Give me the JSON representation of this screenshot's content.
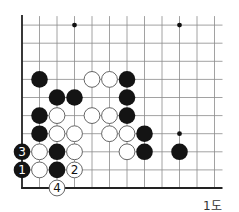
{
  "diagram": {
    "caption": "1도",
    "board": {
      "cols": 12,
      "rows": 10,
      "origin_x": 22,
      "origin_y": 188,
      "col_spacing": 17.5,
      "row_spacing": 18.1,
      "edges": [
        "left",
        "bottom"
      ],
      "line_color": "#8a8a8a",
      "edge_color": "#222222",
      "star_points": [
        [
          3,
          9
        ],
        [
          9,
          9
        ],
        [
          9,
          3
        ]
      ]
    },
    "stones": [
      {
        "color": "black",
        "col": 1,
        "row": 6
      },
      {
        "color": "white",
        "col": 4,
        "row": 6
      },
      {
        "color": "white",
        "col": 5,
        "row": 6
      },
      {
        "color": "black",
        "col": 6,
        "row": 6
      },
      {
        "color": "black",
        "col": 2,
        "row": 5
      },
      {
        "color": "black",
        "col": 3,
        "row": 5
      },
      {
        "color": "black",
        "col": 6,
        "row": 5
      },
      {
        "color": "black",
        "col": 1,
        "row": 4
      },
      {
        "color": "white",
        "col": 2,
        "row": 4
      },
      {
        "color": "white",
        "col": 4,
        "row": 4
      },
      {
        "color": "white",
        "col": 5,
        "row": 4
      },
      {
        "color": "black",
        "col": 6,
        "row": 4
      },
      {
        "color": "black",
        "col": 1,
        "row": 3
      },
      {
        "color": "white",
        "col": 2,
        "row": 3
      },
      {
        "color": "white",
        "col": 3,
        "row": 3
      },
      {
        "color": "white",
        "col": 5,
        "row": 3
      },
      {
        "color": "white",
        "col": 6,
        "row": 3
      },
      {
        "color": "black",
        "col": 7,
        "row": 3
      },
      {
        "color": "black",
        "col": 0,
        "row": 2,
        "label": "3"
      },
      {
        "color": "white",
        "col": 1,
        "row": 2
      },
      {
        "color": "black",
        "col": 2,
        "row": 2
      },
      {
        "color": "white",
        "col": 3,
        "row": 2
      },
      {
        "color": "white",
        "col": 6,
        "row": 2
      },
      {
        "color": "black",
        "col": 7,
        "row": 2
      },
      {
        "color": "black",
        "col": 9,
        "row": 2
      },
      {
        "color": "black",
        "col": 0,
        "row": 1,
        "label": "1"
      },
      {
        "color": "white",
        "col": 1,
        "row": 1
      },
      {
        "color": "black",
        "col": 2,
        "row": 1
      },
      {
        "color": "white",
        "col": 3,
        "row": 1,
        "label": "2"
      },
      {
        "color": "white",
        "col": 2,
        "row": 0,
        "label": "4"
      }
    ],
    "colors": {
      "black_stone": "#141414",
      "white_stone": "#ffffff",
      "white_outline": "#555555",
      "label_on_black": "#ffffff",
      "label_on_white": "#111111"
    }
  }
}
